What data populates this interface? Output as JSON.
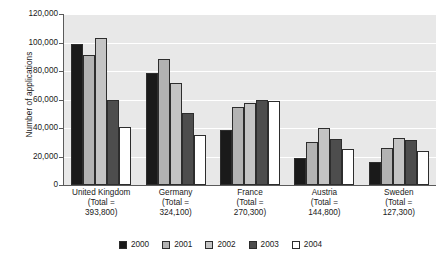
{
  "chart_data": {
    "type": "bar",
    "title": "",
    "xlabel": "",
    "ylabel": "Number of applications",
    "ylim": [
      0,
      120000
    ],
    "ytick_step": 20000,
    "grid": true,
    "grid_axis": "y",
    "legend_position": "bottom",
    "plot_background": "#e8e8e8",
    "gridline_color": "#ffffff",
    "axis_color": "#5a5a5a",
    "categories": [
      "United Kingdom",
      "Germany",
      "France",
      "Austria",
      "Sweden"
    ],
    "category_totals": [
      "393,800",
      "324,100",
      "270,300",
      "144,800",
      "127,300"
    ],
    "category_labels": [
      [
        "United Kingdom",
        "(Total =",
        "393,800)"
      ],
      [
        "Germany",
        "(Total =",
        "324,100)"
      ],
      [
        "France",
        "(Total =",
        "270,300)"
      ],
      [
        "Austria",
        "(Total =",
        "144,800)"
      ],
      [
        "Sweden",
        "(Total =",
        "127,300)"
      ]
    ],
    "ytick_labels": [
      "120,000",
      "100,000",
      "80,000",
      "60,000",
      "40,000",
      "20,000",
      "0"
    ],
    "ytick_values": [
      120000,
      100000,
      80000,
      60000,
      40000,
      20000,
      0
    ],
    "series": [
      {
        "name": "2000",
        "color": "#1a1a1a",
        "values": [
          99000,
          78500,
          38500,
          19000,
          16500
        ]
      },
      {
        "name": "2001",
        "color": "#b3b3b3",
        "values": [
          91000,
          88500,
          54500,
          30500,
          26000
        ]
      },
      {
        "name": "2002",
        "color": "#c4c4c4",
        "values": [
          103000,
          71500,
          57500,
          40000,
          33000
        ]
      },
      {
        "name": "2003",
        "color": "#4d4d4d",
        "values": [
          60000,
          50500,
          59500,
          32500,
          31500
        ]
      },
      {
        "name": "2004",
        "color": "#ffffff",
        "values": [
          40500,
          35000,
          59000,
          25000,
          24000
        ]
      }
    ]
  }
}
